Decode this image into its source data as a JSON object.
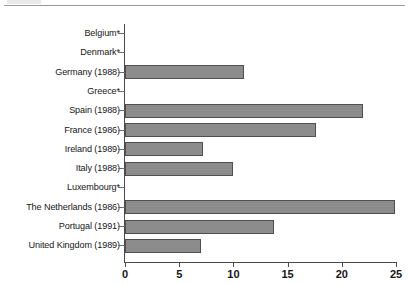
{
  "chart_data": {
    "type": "bar",
    "orientation": "horizontal",
    "title": "",
    "subtitle": "",
    "xlabel": "",
    "ylabel": "",
    "xlim": [
      0,
      25
    ],
    "ylim": null,
    "grid": false,
    "legend": null,
    "xticks": [
      0,
      5,
      10,
      15,
      20,
      25
    ],
    "xtick_labels": [
      "0",
      "5",
      "10",
      "15",
      "20",
      "25"
    ],
    "categories": [
      "Belgium*",
      "Denmark*",
      "Germany (1988)",
      "Greece*",
      "Spain (1988)",
      "France (1986)",
      "Ireland (1989)",
      "Italy (1988)",
      "Luxembourg*",
      "The Netherlands (1986)",
      "Portugal (1991)",
      "United Kingdom (1989)"
    ],
    "values": [
      0,
      0,
      11,
      0,
      22,
      17.6,
      7.2,
      10,
      0,
      24.9,
      13.7,
      7
    ],
    "series": [
      {
        "name": "",
        "values": [
          0,
          0,
          11,
          0,
          22,
          17.6,
          7.2,
          10,
          0,
          24.9,
          13.7,
          7
        ]
      }
    ],
    "bar_color": "#8c8c8c",
    "bar_edge_color": "#4f4f4f",
    "axis_color": "#4a4a4a",
    "text_color": "#161616",
    "annotations": [
      "* denotes no value shown (bar length zero)"
    ]
  }
}
